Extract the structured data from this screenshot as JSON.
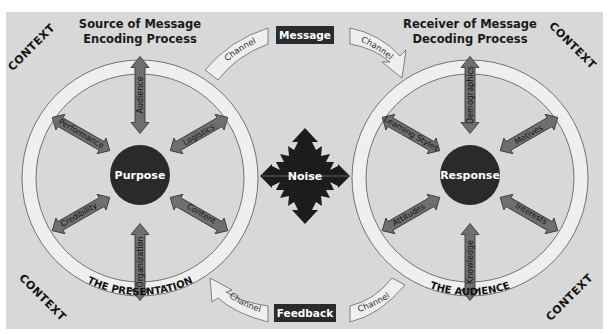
{
  "colors": {
    "background": "#d8d8d8",
    "ring_fill": "#efefef",
    "ring_stroke": "#555555",
    "arrow_fill": "#6f6f6f",
    "arrow_stroke": "#333333",
    "hub_fill": "#2a2a2a",
    "box_fill": "#2b2b2b",
    "noise_fill": "#1c1c1c"
  },
  "context_labels": [
    "CONTEXT",
    "CONTEXT",
    "CONTEXT",
    "CONTEXT"
  ],
  "source": {
    "header_line1": "Source of Message",
    "header_line2": "Encoding Process",
    "hub": "Purpose",
    "ring_label": "THE PRESENTATION",
    "arrows": [
      "Audience",
      "Logistics",
      "Content",
      "Organization",
      "Credibility",
      "Performance"
    ]
  },
  "receiver": {
    "header_line1": "Receiver of Message",
    "header_line2": "Decoding Process",
    "hub": "Response",
    "ring_label": "THE AUDIENCE",
    "arrows": [
      "Demographics",
      "Motives",
      "Interests",
      "Knowledge",
      "Attitudes",
      "Learning Styles"
    ]
  },
  "message_box": "Message",
  "feedback_box": "Feedback",
  "channel_labels": [
    "Channel",
    "Channel",
    "Channel",
    "Channel"
  ],
  "noise": "Noise"
}
